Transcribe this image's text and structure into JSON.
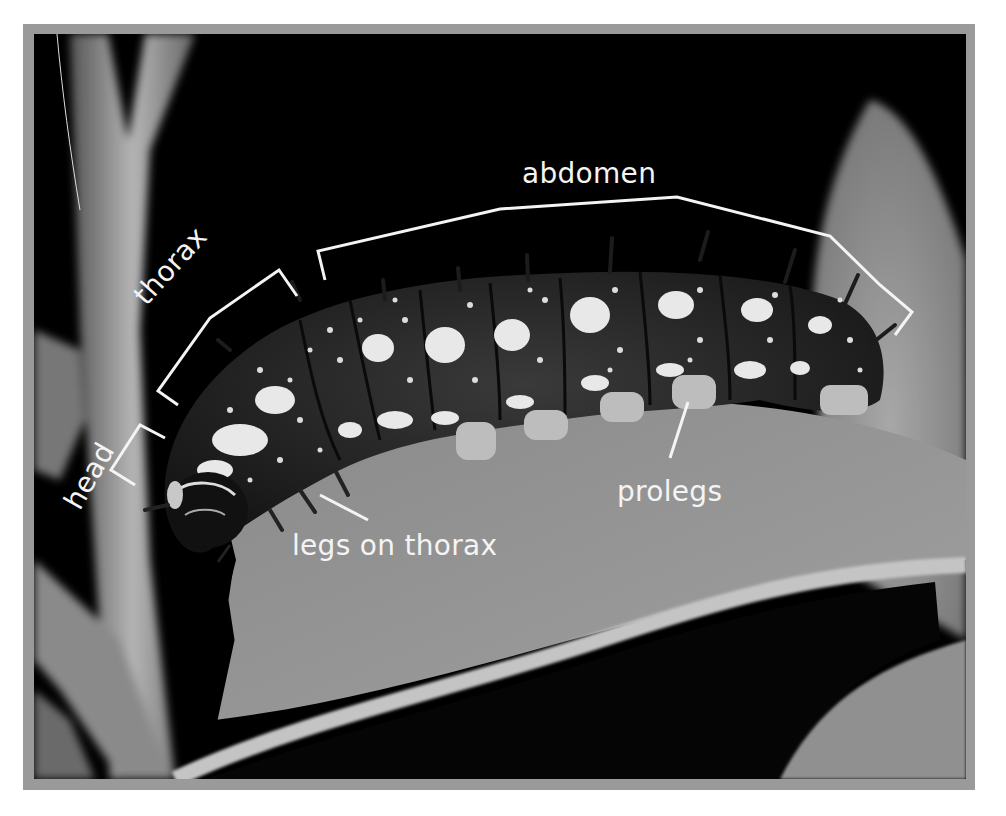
{
  "figure": {
    "style": "black-and-white photograph with white annotation labels and brackets",
    "frame_color": "#9a9a9a",
    "background_color": "#000000",
    "label_color": "#f4f4f4"
  },
  "labels": {
    "abdomen": "abdomen",
    "thorax": "thorax",
    "head": "head",
    "legs_on_thorax": "legs on thorax",
    "prolegs": "prolegs"
  },
  "annotations": [
    {
      "label": "abdomen",
      "type": "bracket"
    },
    {
      "label": "thorax",
      "type": "bracket"
    },
    {
      "label": "head",
      "type": "bracket"
    },
    {
      "label": "legs on thorax",
      "type": "pointer-line"
    },
    {
      "label": "prolegs",
      "type": "pointer-line"
    }
  ]
}
